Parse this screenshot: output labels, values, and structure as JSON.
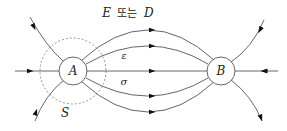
{
  "diagram": {
    "title_label": {
      "var1": "E",
      "conj": "또는",
      "var2": "D"
    },
    "node_a": {
      "label": "A"
    },
    "node_b": {
      "label": "B"
    },
    "epsilon_label": "ε",
    "sigma_label": "σ",
    "surface_label": "S",
    "colors": {
      "line": "#555555",
      "dashed": "#777777",
      "text": "#222222"
    }
  }
}
